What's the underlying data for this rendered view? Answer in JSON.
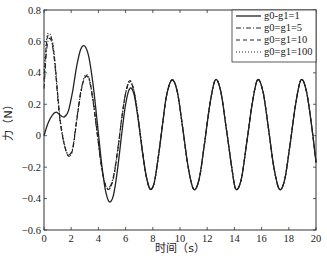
{
  "chart_data": {
    "type": "line",
    "title": "",
    "xlabel": "时间（s）",
    "ylabel": "力（N）",
    "xlim": [
      0,
      20
    ],
    "ylim": [
      -0.6,
      0.8
    ],
    "xticks": [
      0,
      2,
      4,
      6,
      8,
      10,
      12,
      14,
      16,
      18,
      20
    ],
    "yticks": [
      -0.6,
      -0.4,
      -0.2,
      0,
      0.2,
      0.4,
      0.6,
      0.8
    ],
    "xtick_labels": [
      "0",
      "2",
      "4",
      "6",
      "8",
      "10",
      "12",
      "14",
      "16",
      "18",
      "20"
    ],
    "ytick_labels": [
      "-0.6",
      "-0.4",
      "-0.2",
      "0",
      "0.2",
      "0.4",
      "0.6",
      "0.8"
    ],
    "grid": false,
    "legend_position": "upper right",
    "series": [
      {
        "name": "g0-g1=1",
        "style": "solid",
        "x": [
          0,
          0.3,
          0.6,
          0.9,
          1.2,
          1.5,
          1.8,
          2.1,
          2.4,
          2.7,
          3.0,
          3.3,
          3.6,
          3.9,
          4.2,
          4.5,
          4.8,
          5.1,
          5.4,
          5.7,
          6.0,
          6.3,
          6.6,
          6.9,
          7.2,
          7.5,
          7.8,
          8.1,
          8.4,
          8.7,
          9.0,
          9.4,
          9.8,
          10.2,
          10.6,
          11.0,
          11.4,
          11.8,
          12.2,
          12.6,
          13.0,
          13.4,
          13.8,
          14.1,
          14.5,
          14.9,
          15.3,
          15.7,
          16.1,
          16.5,
          16.9,
          17.3,
          17.7,
          18.1,
          18.5,
          18.9,
          19.3,
          19.7,
          20.0
        ],
        "y": [
          0.0,
          0.08,
          0.13,
          0.15,
          0.13,
          0.12,
          0.16,
          0.28,
          0.44,
          0.55,
          0.57,
          0.5,
          0.33,
          0.1,
          -0.15,
          -0.34,
          -0.42,
          -0.38,
          -0.22,
          0.0,
          0.2,
          0.3,
          0.27,
          0.12,
          -0.08,
          -0.25,
          -0.34,
          -0.3,
          -0.14,
          0.06,
          0.25,
          0.355,
          0.28,
          0.05,
          -0.2,
          -0.34,
          -0.28,
          -0.05,
          0.2,
          0.355,
          0.28,
          0.05,
          -0.2,
          -0.34,
          -0.28,
          -0.05,
          0.2,
          0.355,
          0.28,
          0.05,
          -0.2,
          -0.34,
          -0.28,
          -0.05,
          0.2,
          0.355,
          0.28,
          0.05,
          -0.17
        ]
      },
      {
        "name": "g0=g1=5",
        "style": "dashdot",
        "x": [
          0,
          0.2,
          0.4,
          0.6,
          0.8,
          1.0,
          1.2,
          1.5,
          1.8,
          2.1,
          2.4,
          2.7,
          3.0,
          3.3,
          3.6,
          3.9,
          4.2,
          4.5,
          4.8,
          5.1,
          5.4,
          5.7,
          6.0,
          6.3,
          6.6,
          6.9,
          7.2,
          7.5,
          7.8,
          8.1,
          8.4,
          8.7,
          9.0,
          9.4,
          9.8,
          10.2,
          10.6,
          11.0,
          11.4,
          11.8,
          12.2,
          12.6,
          13.0,
          13.4,
          13.8,
          14.1,
          14.5,
          14.9,
          15.3,
          15.7,
          16.1,
          16.5,
          16.9,
          17.3,
          17.7,
          18.1,
          18.5,
          18.9,
          19.3,
          19.7,
          20.0
        ],
        "y": [
          0.3,
          0.55,
          0.62,
          0.58,
          0.45,
          0.25,
          0.08,
          -0.06,
          -0.12,
          -0.08,
          0.1,
          0.28,
          0.37,
          0.36,
          0.22,
          0.02,
          -0.18,
          -0.31,
          -0.33,
          -0.26,
          -0.1,
          0.1,
          0.27,
          0.34,
          0.29,
          0.13,
          -0.07,
          -0.25,
          -0.34,
          -0.3,
          -0.14,
          0.06,
          0.25,
          0.355,
          0.28,
          0.05,
          -0.2,
          -0.34,
          -0.28,
          -0.05,
          0.2,
          0.355,
          0.28,
          0.05,
          -0.2,
          -0.34,
          -0.28,
          -0.05,
          0.2,
          0.355,
          0.28,
          0.05,
          -0.2,
          -0.34,
          -0.28,
          -0.05,
          0.2,
          0.355,
          0.28,
          0.05,
          -0.17
        ]
      },
      {
        "name": "g0=g1=10",
        "style": "dashed",
        "x": [
          0,
          0.2,
          0.4,
          0.6,
          0.8,
          1.0,
          1.2,
          1.5,
          1.8,
          2.1,
          2.4,
          2.7,
          3.0,
          3.3,
          3.6,
          3.9,
          4.2,
          4.5,
          4.8,
          5.1,
          5.4,
          5.7,
          6.0,
          6.3,
          6.6,
          6.9,
          7.2,
          7.5,
          7.8,
          8.1,
          8.4,
          8.7,
          9.0,
          9.4,
          9.8,
          10.2,
          10.6,
          11.0,
          11.4,
          11.8,
          12.2,
          12.6,
          13.0,
          13.4,
          13.8,
          14.1,
          14.5,
          14.9,
          15.3,
          15.7,
          16.1,
          16.5,
          16.9,
          17.3,
          17.7,
          18.1,
          18.5,
          18.9,
          19.3,
          19.7,
          20.0
        ],
        "y": [
          0.35,
          0.6,
          0.64,
          0.6,
          0.47,
          0.27,
          0.09,
          -0.06,
          -0.13,
          -0.09,
          0.09,
          0.27,
          0.37,
          0.37,
          0.23,
          0.03,
          -0.18,
          -0.31,
          -0.34,
          -0.27,
          -0.11,
          0.1,
          0.27,
          0.35,
          0.29,
          0.13,
          -0.07,
          -0.25,
          -0.34,
          -0.3,
          -0.14,
          0.06,
          0.25,
          0.355,
          0.28,
          0.05,
          -0.2,
          -0.34,
          -0.28,
          -0.05,
          0.2,
          0.355,
          0.28,
          0.05,
          -0.2,
          -0.34,
          -0.28,
          -0.05,
          0.2,
          0.355,
          0.28,
          0.05,
          -0.2,
          -0.34,
          -0.28,
          -0.05,
          0.2,
          0.355,
          0.28,
          0.05,
          -0.17
        ]
      },
      {
        "name": "g0=g1=100",
        "style": "dotted",
        "x": [
          0,
          0.2,
          0.4,
          0.6,
          0.8,
          1.0,
          1.2,
          1.5,
          1.8,
          2.1,
          2.4,
          2.7,
          3.0,
          3.3,
          3.6,
          3.9,
          4.2,
          4.5,
          4.8,
          5.1,
          5.4,
          5.7,
          6.0,
          6.3,
          6.6,
          6.9,
          7.2,
          7.5,
          7.8,
          8.1,
          8.4,
          8.7,
          9.0,
          9.4,
          9.8,
          10.2,
          10.6,
          11.0,
          11.4,
          11.8,
          12.2,
          12.6,
          13.0,
          13.4,
          13.8,
          14.1,
          14.5,
          14.9,
          15.3,
          15.7,
          16.1,
          16.5,
          16.9,
          17.3,
          17.7,
          18.1,
          18.5,
          18.9,
          19.3,
          19.7,
          20.0
        ],
        "y": [
          0.4,
          0.62,
          0.65,
          0.61,
          0.48,
          0.28,
          0.1,
          -0.05,
          -0.13,
          -0.09,
          0.09,
          0.27,
          0.38,
          0.37,
          0.23,
          0.03,
          -0.18,
          -0.31,
          -0.34,
          -0.27,
          -0.11,
          0.1,
          0.27,
          0.35,
          0.29,
          0.13,
          -0.07,
          -0.25,
          -0.34,
          -0.3,
          -0.14,
          0.06,
          0.25,
          0.355,
          0.28,
          0.05,
          -0.2,
          -0.34,
          -0.28,
          -0.05,
          0.2,
          0.355,
          0.28,
          0.05,
          -0.2,
          -0.34,
          -0.28,
          -0.05,
          0.2,
          0.355,
          0.28,
          0.05,
          -0.2,
          -0.34,
          -0.28,
          -0.05,
          0.2,
          0.355,
          0.28,
          0.05,
          -0.17
        ]
      }
    ]
  },
  "colors": {
    "line": "#222222",
    "axis": "#333333",
    "background": "#ffffff"
  }
}
